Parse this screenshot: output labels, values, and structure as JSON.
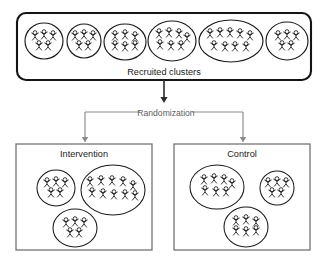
{
  "diagram": {
    "colors": {
      "outline_dark": "#141414",
      "panel_outline": "#6e6e6e",
      "cluster_outline": "#1a1a1a",
      "figure_stroke": "#151515",
      "arrow_dark": "#2b2b2b",
      "arrow_gray": "#8a8a8a",
      "label_text": "#1b1b1b",
      "randomization_text": "#5e5e5e",
      "background": "#ffffff"
    }
  },
  "recruited": {
    "label": "Recruited clusters",
    "box": {
      "x": 17,
      "y": 13,
      "width": 294,
      "height": 67,
      "corner_radius": 9
    },
    "cluster_count": 6,
    "total_people": 37,
    "clusters": [
      {
        "name": "cluster-1",
        "people": 5,
        "cx": 44,
        "cy": 41,
        "rx": 19,
        "ry": 18
      },
      {
        "name": "cluster-2",
        "people": 5,
        "cx": 84,
        "cy": 41,
        "rx": 17,
        "ry": 17
      },
      {
        "name": "cluster-3",
        "people": 6,
        "cx": 125,
        "cy": 42,
        "rx": 21,
        "ry": 18
      },
      {
        "name": "cluster-4",
        "people": 7,
        "cx": 172,
        "cy": 41,
        "rx": 24,
        "ry": 20
      },
      {
        "name": "cluster-5",
        "people": 9,
        "cx": 231,
        "cy": 41,
        "rx": 32,
        "ry": 21
      },
      {
        "name": "cluster-6",
        "people": 5,
        "cx": 287,
        "cy": 41,
        "rx": 21,
        "ry": 19
      }
    ]
  },
  "randomization": {
    "label": "Randomization",
    "arrow_in": {
      "from_y": 80,
      "to_y": 102,
      "x": 164
    },
    "bracket": {
      "y": 112,
      "left_x": 85,
      "right_x": 243,
      "stub_left_end": 140,
      "stub_right_start": 192
    },
    "arrows_out": [
      {
        "name": "arrow-to-intervention",
        "x": 85,
        "from_y": 112,
        "to_y": 142
      },
      {
        "name": "arrow-to-control",
        "x": 243,
        "from_y": 112,
        "to_y": 142
      }
    ]
  },
  "arms": [
    {
      "name": "intervention",
      "label": "Intervention",
      "box": {
        "x": 16,
        "y": 144,
        "width": 136,
        "height": 106
      },
      "cluster_count": 3,
      "total_people": 20,
      "clusters": [
        {
          "name": "intervention-cluster-1",
          "people": 5,
          "cx": 56,
          "cy": 188,
          "rx": 19,
          "ry": 18
        },
        {
          "name": "intervention-cluster-2",
          "people": 10,
          "cx": 113,
          "cy": 190,
          "rx": 32,
          "ry": 25
        },
        {
          "name": "intervention-cluster-3",
          "people": 5,
          "cx": 75,
          "cy": 228,
          "rx": 22,
          "ry": 19
        }
      ]
    },
    {
      "name": "control",
      "label": "Control",
      "box": {
        "x": 174,
        "y": 144,
        "width": 136,
        "height": 106
      },
      "cluster_count": 3,
      "total_people": 18,
      "clusters": [
        {
          "name": "control-cluster-1",
          "people": 7,
          "cx": 217,
          "cy": 187,
          "rx": 27,
          "ry": 22
        },
        {
          "name": "control-cluster-2",
          "people": 5,
          "cx": 277,
          "cy": 188,
          "rx": 17,
          "ry": 17
        },
        {
          "name": "control-cluster-3",
          "people": 6,
          "cx": 246,
          "cy": 227,
          "rx": 22,
          "ry": 20
        }
      ]
    }
  ],
  "people_layouts": {
    "5": [
      [
        -9,
        -5
      ],
      [
        0,
        -6
      ],
      [
        9,
        -5
      ],
      [
        -5,
        5
      ],
      [
        4,
        5
      ]
    ],
    "6": [
      [
        -10,
        -6
      ],
      [
        0,
        -7
      ],
      [
        10,
        -5
      ],
      [
        -10,
        4
      ],
      [
        0,
        5
      ],
      [
        10,
        4
      ]
    ],
    "7": [
      [
        -13,
        -7
      ],
      [
        -3,
        -8
      ],
      [
        7,
        -7
      ],
      [
        15,
        -3
      ],
      [
        -12,
        4
      ],
      [
        -1,
        5
      ],
      [
        9,
        5
      ]
    ],
    "9": [
      [
        -21,
        -7
      ],
      [
        -11,
        -8
      ],
      [
        -1,
        -8
      ],
      [
        9,
        -7
      ],
      [
        19,
        -5
      ],
      [
        -17,
        5
      ],
      [
        -6,
        6
      ],
      [
        4,
        6
      ],
      [
        15,
        6
      ]
    ],
    "10": [
      [
        -23,
        -8
      ],
      [
        -12,
        -9
      ],
      [
        -1,
        -9
      ],
      [
        10,
        -8
      ],
      [
        20,
        -4
      ],
      [
        -21,
        3
      ],
      [
        -10,
        4
      ],
      [
        1,
        5
      ],
      [
        12,
        5
      ],
      [
        22,
        6
      ]
    ]
  }
}
